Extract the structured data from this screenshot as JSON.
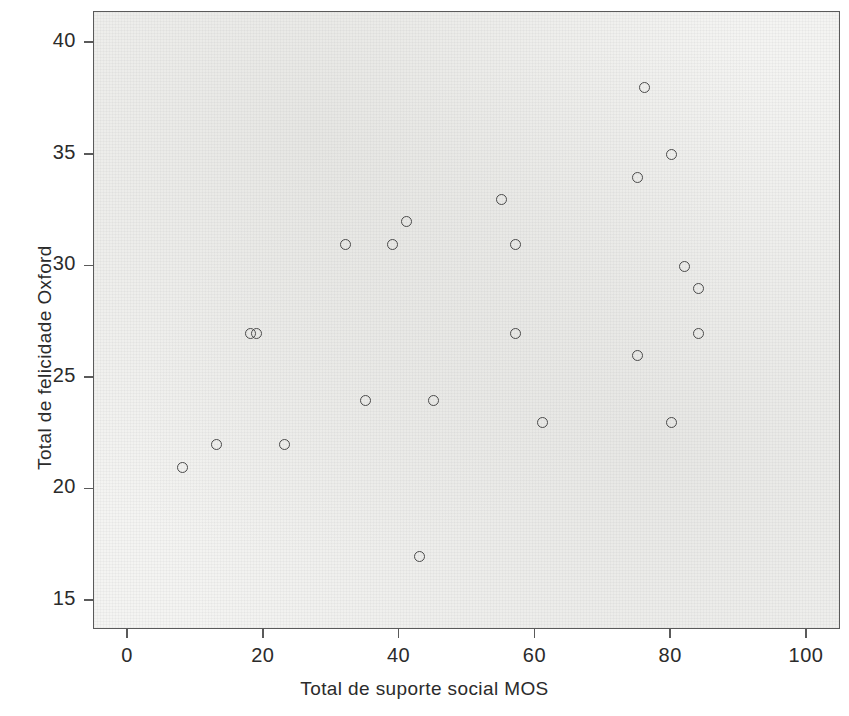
{
  "chart_data": {
    "type": "scatter",
    "title": "",
    "xlabel": "Total de suporte social MOS",
    "ylabel": "Total de felicidade Oxford",
    "xlim": [
      -5,
      105
    ],
    "ylim": [
      13.7,
      41.4
    ],
    "xticks": [
      0,
      20,
      40,
      60,
      80,
      100
    ],
    "xticklabels": [
      "0",
      "20",
      "40",
      "60",
      "80",
      "100"
    ],
    "yticks": [
      15,
      20,
      25,
      30,
      35,
      40
    ],
    "yticklabels": [
      "15",
      "20",
      "25",
      "30",
      "35",
      "40"
    ],
    "grid": false,
    "legend": null,
    "marker": "open-circle",
    "marker_color": "#4a4a4a",
    "panel_background": "#f4f4f2",
    "points": [
      {
        "x": 8,
        "y": 21
      },
      {
        "x": 13,
        "y": 22
      },
      {
        "x": 18,
        "y": 27
      },
      {
        "x": 19,
        "y": 27
      },
      {
        "x": 23,
        "y": 22
      },
      {
        "x": 32,
        "y": 31
      },
      {
        "x": 35,
        "y": 24
      },
      {
        "x": 39,
        "y": 31
      },
      {
        "x": 41,
        "y": 32
      },
      {
        "x": 43,
        "y": 17
      },
      {
        "x": 45,
        "y": 24
      },
      {
        "x": 55,
        "y": 33
      },
      {
        "x": 57,
        "y": 31
      },
      {
        "x": 57,
        "y": 27
      },
      {
        "x": 61,
        "y": 23
      },
      {
        "x": 75,
        "y": 34
      },
      {
        "x": 75,
        "y": 26
      },
      {
        "x": 76,
        "y": 38
      },
      {
        "x": 80,
        "y": 35
      },
      {
        "x": 80,
        "y": 23
      },
      {
        "x": 82,
        "y": 30
      },
      {
        "x": 84,
        "y": 29
      },
      {
        "x": 84,
        "y": 27
      }
    ]
  }
}
